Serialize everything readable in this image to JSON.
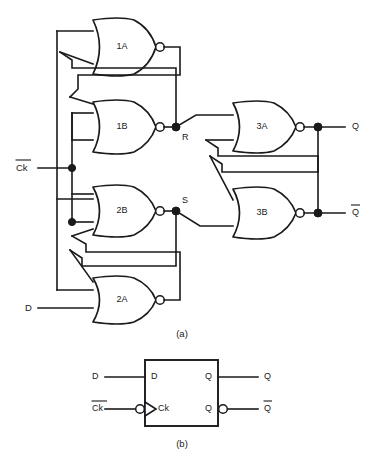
{
  "figure": {
    "captions": {
      "a": "(a)",
      "b": "(b)"
    }
  },
  "schematic": {
    "gates": [
      {
        "id": "1A",
        "label": "1A",
        "type": "nor-gate",
        "inputs": 2
      },
      {
        "id": "1B",
        "label": "1B",
        "type": "nor-gate",
        "inputs": 3
      },
      {
        "id": "2B",
        "label": "2B",
        "type": "nor-gate",
        "inputs": 3
      },
      {
        "id": "2A",
        "label": "2A",
        "type": "nor-gate",
        "inputs": 2
      },
      {
        "id": "3A",
        "label": "3A",
        "type": "nor-gate",
        "inputs": 2
      },
      {
        "id": "3B",
        "label": "3B",
        "type": "nor-gate",
        "inputs": 2
      }
    ],
    "inputs": [
      {
        "id": "ck",
        "label": "Ck",
        "overbar": true
      },
      {
        "id": "d",
        "label": "D",
        "overbar": false
      }
    ],
    "outputs": [
      {
        "id": "q",
        "label": "Q",
        "overbar": false
      },
      {
        "id": "qbar",
        "label": "Q",
        "overbar": true
      }
    ],
    "internal_nodes": [
      {
        "id": "r",
        "label": "R"
      },
      {
        "id": "s",
        "label": "S"
      }
    ]
  },
  "block": {
    "input_labels": [
      {
        "id": "d-in",
        "label": "D",
        "overbar": false
      },
      {
        "id": "ck-in",
        "label": "Ck",
        "overbar": true
      }
    ],
    "output_labels": [
      {
        "id": "q-out",
        "label": "Q",
        "overbar": false
      },
      {
        "id": "qbar-out",
        "label": "Q",
        "overbar": true
      }
    ],
    "pins": [
      {
        "id": "pin-d",
        "label": "D"
      },
      {
        "id": "pin-ck",
        "label": "Ck"
      },
      {
        "id": "pin-q",
        "label": "Q"
      },
      {
        "id": "pin-qbar",
        "label": "Q"
      }
    ]
  },
  "colors": {
    "ink": "#1a1a1a",
    "paper": "#ffffff"
  }
}
